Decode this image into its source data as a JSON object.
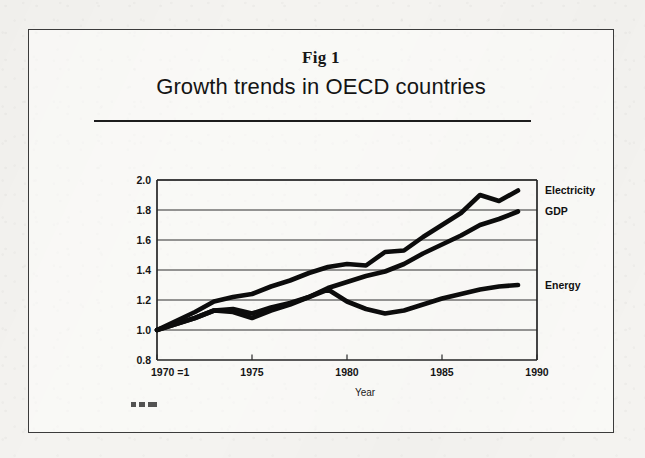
{
  "document": {
    "kind": "scanned-figure",
    "fig_number": "Fig 1",
    "title": "Growth trends in OECD countries",
    "artifact_note": ""
  },
  "chart_data": {
    "type": "line",
    "title": "Growth trends in OECD countries",
    "subtitle": "Fig 1",
    "xlabel": "Year",
    "ylabel": "",
    "xlim": [
      1970,
      1990
    ],
    "ylim": [
      0.8,
      2.0
    ],
    "grid": true,
    "legend_position": "right-inline",
    "x_ticks": [
      1970,
      1975,
      1980,
      1985,
      1990
    ],
    "x_tick_labels": [
      "1970 =1",
      "1975",
      "1980",
      "1985",
      "1990"
    ],
    "y_ticks": [
      0.8,
      1.0,
      1.2,
      1.4,
      1.6,
      1.8,
      2.0
    ],
    "y_tick_labels": [
      "0.8",
      "1.0",
      "1.2",
      "1.4",
      "1.6",
      "1.8",
      "2.0"
    ],
    "x": [
      1970,
      1971,
      1972,
      1973,
      1974,
      1975,
      1976,
      1977,
      1978,
      1979,
      1980,
      1981,
      1982,
      1983,
      1984,
      1985,
      1986,
      1987,
      1988,
      1989
    ],
    "series": [
      {
        "name": "Electricity",
        "label": "Electricity",
        "color": "#0c0c0c",
        "end_value": 1.93,
        "values": [
          1.0,
          1.06,
          1.12,
          1.19,
          1.22,
          1.24,
          1.29,
          1.33,
          1.38,
          1.42,
          1.44,
          1.43,
          1.52,
          1.53,
          1.62,
          1.7,
          1.78,
          1.9,
          1.86,
          1.93
        ]
      },
      {
        "name": "GDP",
        "label": "GDP",
        "color": "#0c0c0c",
        "end_value": 1.79,
        "values": [
          1.0,
          1.04,
          1.08,
          1.13,
          1.12,
          1.08,
          1.13,
          1.17,
          1.22,
          1.28,
          1.32,
          1.36,
          1.39,
          1.44,
          1.51,
          1.57,
          1.63,
          1.7,
          1.74,
          1.79
        ]
      },
      {
        "name": "Energy",
        "label": "Energy",
        "color": "#0c0c0c",
        "end_value": 1.3,
        "values": [
          1.0,
          1.04,
          1.08,
          1.13,
          1.14,
          1.11,
          1.15,
          1.18,
          1.22,
          1.27,
          1.19,
          1.14,
          1.11,
          1.13,
          1.17,
          1.21,
          1.24,
          1.27,
          1.29,
          1.3
        ]
      }
    ],
    "series_label_anchors": [
      {
        "name": "Electricity",
        "y_value": 1.93
      },
      {
        "name": "GDP",
        "y_value": 1.79
      },
      {
        "name": "Energy",
        "y_value": 1.3
      }
    ]
  }
}
